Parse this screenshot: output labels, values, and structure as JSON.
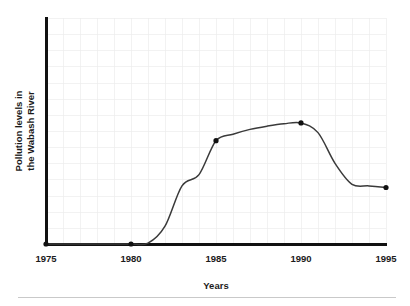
{
  "chart_data": {
    "type": "line",
    "title": "",
    "xlabel": "Years",
    "ylabel": "Pollution levels in the Wabash River",
    "ylabel_line1": "Pollution levels in",
    "ylabel_line2": "the Wabash River",
    "xlim": [
      1975,
      1995
    ],
    "ylim": [
      0,
      14
    ],
    "xticks": [
      1975,
      1980,
      1985,
      1990,
      1995
    ],
    "xtick_labels": [
      "1975",
      "1980",
      "1985",
      "1990",
      "1995"
    ],
    "yticks": [],
    "ytick_labels": [],
    "grid": true,
    "grid_x_step": 1,
    "grid_y_step": 1,
    "legend": false,
    "legend_position": "none",
    "series": [
      {
        "name": "Pollution level",
        "x": [
          1975,
          1980,
          1985,
          1990,
          1995
        ],
        "values": [
          0,
          0,
          6.4,
          7.5,
          3.5
        ],
        "marker": "filled-circle",
        "line_color": "#3a3a3a",
        "marker_color": "#111111"
      }
    ],
    "curve_points": [
      {
        "x": 1975,
        "y": 0
      },
      {
        "x": 1976,
        "y": 0
      },
      {
        "x": 1977,
        "y": 0
      },
      {
        "x": 1978,
        "y": 0
      },
      {
        "x": 1979,
        "y": 0
      },
      {
        "x": 1980,
        "y": 0
      },
      {
        "x": 1981,
        "y": 0.05
      },
      {
        "x": 1982,
        "y": 1.1
      },
      {
        "x": 1983,
        "y": 3.6
      },
      {
        "x": 1984,
        "y": 4.3
      },
      {
        "x": 1985,
        "y": 6.4
      },
      {
        "x": 1986,
        "y": 6.8
      },
      {
        "x": 1987,
        "y": 7.1
      },
      {
        "x": 1988,
        "y": 7.3
      },
      {
        "x": 1989,
        "y": 7.45
      },
      {
        "x": 1990,
        "y": 7.5
      },
      {
        "x": 1991,
        "y": 6.9
      },
      {
        "x": 1992,
        "y": 5.0
      },
      {
        "x": 1993,
        "y": 3.7
      },
      {
        "x": 1994,
        "y": 3.6
      },
      {
        "x": 1995,
        "y": 3.5
      }
    ],
    "annotations": []
  },
  "colors": {
    "background": "#ffffff",
    "grid": "#ececec",
    "axis": "#111111",
    "curve": "#3a3a3a",
    "marker": "#111111",
    "text": "#1b1b1b",
    "footer_rule": "#c9c9c9"
  }
}
